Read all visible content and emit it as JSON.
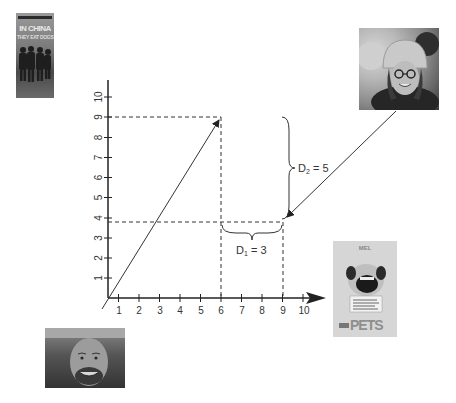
{
  "diagram": {
    "x_axis": {
      "ticks": [
        "1",
        "2",
        "3",
        "4",
        "5",
        "6",
        "7",
        "8",
        "9",
        "10"
      ],
      "origin_px": [
        108,
        298
      ],
      "unit_px": 20.5
    },
    "y_axis": {
      "ticks": [
        "1",
        "2",
        "3",
        "4",
        "5",
        "6",
        "7",
        "8",
        "9",
        "10"
      ],
      "unit_px": 20.1
    },
    "points": [
      {
        "name": "target-point",
        "x": 6,
        "y": 9
      },
      {
        "name": "midpoint",
        "x": 9,
        "y": 4
      }
    ],
    "annotations": {
      "d1": {
        "label": "D",
        "sub": "1",
        "value": " = 3"
      },
      "d2": {
        "label": "D",
        "sub": "2",
        "value": " = 5"
      }
    },
    "colors": {
      "axis": "#222222",
      "dashed": "#333333",
      "arrow": "#333333"
    }
  },
  "images": {
    "poster_left": {
      "banner": "INDEPENDENT FILM",
      "title_line1": "IN CHINA",
      "title_line2": "THEY EAT DOGS"
    },
    "portrait_top_right": {
      "description": "woman with helmet and glasses"
    },
    "portrait_bottom_left": {
      "description": "smiling bald man"
    },
    "poster_right": {
      "header": "MEL",
      "sign_text": "I ate breakfast, ate lunch, ate dinner",
      "title": "PETS"
    }
  }
}
